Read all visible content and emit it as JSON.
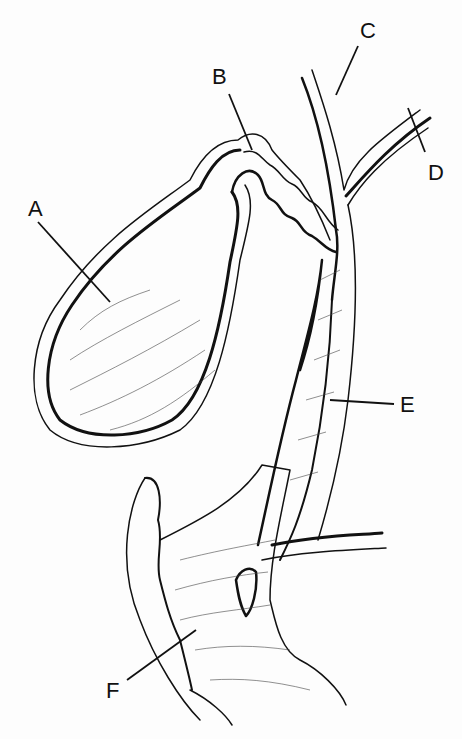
{
  "figure": {
    "background": "#fdfdfd",
    "ink": "#111111",
    "labels": [
      {
        "id": "A",
        "text": "A",
        "x": 28,
        "y": 198,
        "line": [
          38,
          222,
          110,
          302
        ]
      },
      {
        "id": "B",
        "text": "B",
        "x": 212,
        "y": 66,
        "line": [
          229,
          94,
          252,
          150
        ]
      },
      {
        "id": "C",
        "text": "C",
        "x": 360,
        "y": 20,
        "line": [
          358,
          46,
          336,
          95
        ]
      },
      {
        "id": "D",
        "text": "D",
        "x": 428,
        "y": 162,
        "line": [
          425,
          152,
          408,
          108
        ]
      },
      {
        "id": "E",
        "text": "E",
        "x": 400,
        "y": 394,
        "line": [
          394,
          404,
          330,
          400
        ]
      },
      {
        "id": "F",
        "text": "F",
        "x": 106,
        "y": 680,
        "line": [
          127,
          680,
          196,
          630
        ]
      }
    ]
  }
}
